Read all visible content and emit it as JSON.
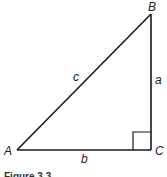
{
  "diagram": {
    "type": "right-triangle",
    "vertices": {
      "A": {
        "label": "A"
      },
      "B": {
        "label": "B"
      },
      "C": {
        "label": "C"
      }
    },
    "sides": {
      "a": {
        "label": "a"
      },
      "b": {
        "label": "b"
      },
      "c": {
        "label": "c"
      }
    },
    "right_angle_at": "C",
    "caption": "Figure 3.3"
  }
}
